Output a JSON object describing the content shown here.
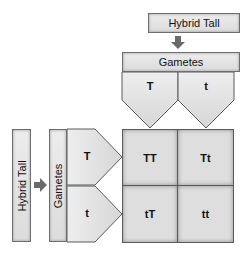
{
  "diagram": {
    "type": "punnett-square",
    "top_parent": {
      "label": "Hybrid Tall"
    },
    "top_gametes_header": {
      "label": "Gametes"
    },
    "top_gametes": [
      {
        "label": "T"
      },
      {
        "label": "t"
      }
    ],
    "left_parent": {
      "label": "Hybrid Tall"
    },
    "left_gametes_header": {
      "label": "Gametes"
    },
    "left_gametes": [
      {
        "label": "T"
      },
      {
        "label": "t"
      }
    ],
    "grid": [
      [
        {
          "label": "TT"
        },
        {
          "label": "Tt"
        }
      ],
      [
        {
          "label": "tT"
        },
        {
          "label": "tt"
        }
      ]
    ],
    "colors": {
      "box_fill": "#e4e4e4",
      "border": "#5a5a5a",
      "arrow": "#6a6a6a"
    }
  }
}
